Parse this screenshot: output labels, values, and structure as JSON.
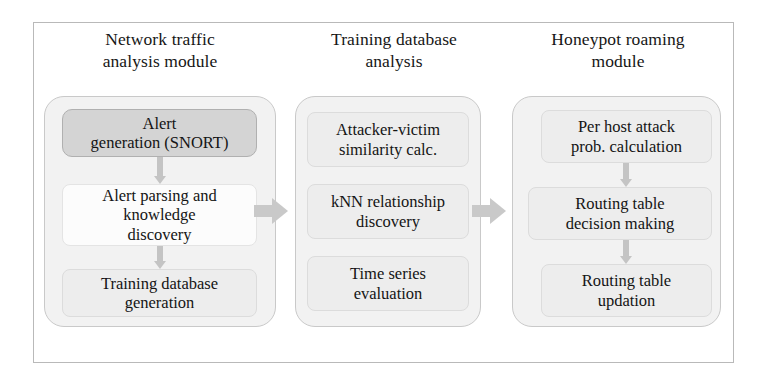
{
  "figure": {
    "kind": "block-diagram",
    "orientation": "left-to-right pipeline of three modules"
  },
  "colors": {
    "frame_border": "#b9b9b9",
    "panel_fill": "#f2f2f2",
    "panel_border": "#c9c9c9",
    "box_light_fill": "#ededed",
    "box_white_fill": "#fcfcfc",
    "box_dark_fill": "#d4d4d4",
    "arrow_fill": "#c4c4c4",
    "text": "#141414",
    "page_background": "#ffffff"
  },
  "columns": [
    {
      "id": "network-traffic-analysis-module",
      "title": "Network traffic\nanalysis module",
      "steps": [
        {
          "id": "alert-generation-snort",
          "label": "Alert\ngeneration (SNORT)",
          "style": "dark"
        },
        {
          "id": "alert-parsing-and-knowledge-discovery",
          "label": "Alert parsing and\nknowledge\ndiscovery",
          "style": "white"
        },
        {
          "id": "training-database-generation",
          "label": "Training database\ngeneration",
          "style": "light"
        }
      ],
      "internal_arrows": 2
    },
    {
      "id": "training-database-analysis",
      "title": "Training database\nanalysis",
      "steps": [
        {
          "id": "attacker-victim-similarity-calc",
          "label": "Attacker-victim\nsimilarity calc.",
          "style": "light"
        },
        {
          "id": "knn-relationship-discovery",
          "label": "kNN relationship\ndiscovery",
          "style": "light"
        },
        {
          "id": "time-series-evaluation",
          "label": "Time series\nevaluation",
          "style": "light"
        }
      ],
      "internal_arrows": 0
    },
    {
      "id": "honeypot-roaming-module",
      "title": "Honeypot roaming\nmodule",
      "steps": [
        {
          "id": "per-host-attack-prob-calculation",
          "label": "Per host attack\nprob. calculation",
          "style": "light"
        },
        {
          "id": "routing-table-decision-making",
          "label": "Routing table\ndecision making",
          "style": "light"
        },
        {
          "id": "routing-table-updation",
          "label": "Routing table\nupdation",
          "style": "light"
        }
      ],
      "internal_arrows": 2
    }
  ],
  "connectors": [
    {
      "id": "arrow-module1-to-module2",
      "from": "network-traffic-analysis-module",
      "to": "training-database-analysis",
      "direction": "right"
    },
    {
      "id": "arrow-module2-to-module3",
      "from": "training-database-analysis",
      "to": "honeypot-roaming-module",
      "direction": "right"
    }
  ]
}
